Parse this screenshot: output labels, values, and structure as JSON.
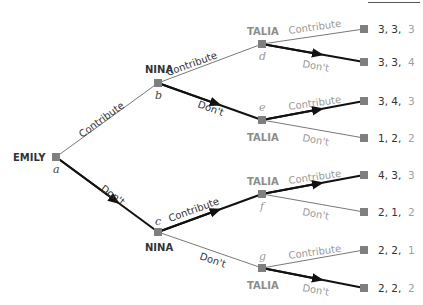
{
  "diagram": {
    "type": "extensive-form game tree",
    "colors": {
      "node": "#7f7f7f",
      "thin_edge": "#555555",
      "thick_edge": "#111111",
      "light_text": "#9a9a9a",
      "dark_text": "#333333"
    },
    "players": {
      "emily": "EMILY",
      "nina_top": "NINA",
      "nina_bottom": "NINA",
      "talia_d": "TALIA",
      "talia_e": "TALIA",
      "talia_f": "TALIA",
      "talia_g": "TALIA"
    },
    "nodes": {
      "a": "a",
      "b": "b",
      "c": "c",
      "d": "d",
      "e": "e",
      "f": "f",
      "g": "g"
    },
    "edges": {
      "a_b": "Contribute",
      "a_c": "Don't",
      "b_d": "Contribute",
      "b_e": "Don't",
      "c_f": "Contribute",
      "c_g": "Don't",
      "d_t1": "Contribute",
      "d_t2": "Don't",
      "e_t3": "Contribute",
      "e_t4": "Don't",
      "f_t5": "Contribute",
      "f_t6": "Don't",
      "g_t7": "Contribute",
      "g_t8": "Don't"
    },
    "payoffs": [
      {
        "first": "3, 3,",
        "last": "3"
      },
      {
        "first": "3, 3,",
        "last": "4"
      },
      {
        "first": "3, 4,",
        "last": "3"
      },
      {
        "first": "1, 2,",
        "last": "2"
      },
      {
        "first": "4, 3,",
        "last": "3"
      },
      {
        "first": "2, 1,",
        "last": "2"
      },
      {
        "first": "2, 2,",
        "last": "1"
      },
      {
        "first": "2, 2,",
        "last": "2"
      }
    ]
  }
}
